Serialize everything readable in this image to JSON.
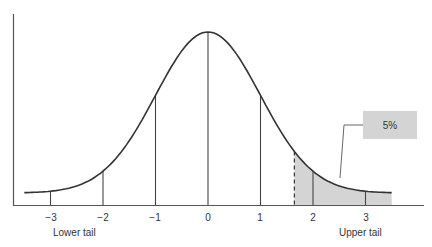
{
  "chart_data": {
    "type": "area",
    "title": "",
    "xlabel": "",
    "ylabel": "",
    "x_ticks": [
      "−3",
      "−2",
      "−1",
      "0",
      "1",
      "2",
      "3"
    ],
    "x_tick_values": [
      -3,
      -2,
      -1,
      0,
      1,
      2,
      3
    ],
    "xlim": [
      -3.7,
      4.1
    ],
    "grid": false,
    "critical_value": 1.645,
    "shaded_region": {
      "from": 1.645,
      "to": 3.5,
      "area_label": "5%"
    },
    "tail_labels": {
      "lower": "Lower tail",
      "upper": "Upper tail"
    },
    "callout": "5%",
    "colors": {
      "curve": "#333333",
      "shade": "#d4d4d4",
      "callout_box": "#d4d4d4",
      "axis": "#555555"
    }
  },
  "labels": {
    "ticks": [
      "−3",
      "−2",
      "−1",
      "0",
      "1",
      "2",
      "3"
    ],
    "lower_tail": "Lower tail",
    "upper_tail": "Upper tail",
    "callout": "5%"
  }
}
